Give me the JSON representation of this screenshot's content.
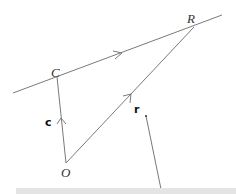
{
  "diagram": {
    "points": {
      "C": {
        "label": "C"
      },
      "O": {
        "label": "O"
      },
      "R": {
        "label": "R"
      }
    },
    "vectors": {
      "c": {
        "label": "c"
      },
      "r": {
        "label": "r"
      }
    },
    "colors": {
      "line": "#7a7a7a",
      "text": "#333333",
      "bar": "#e4e4e4"
    }
  }
}
